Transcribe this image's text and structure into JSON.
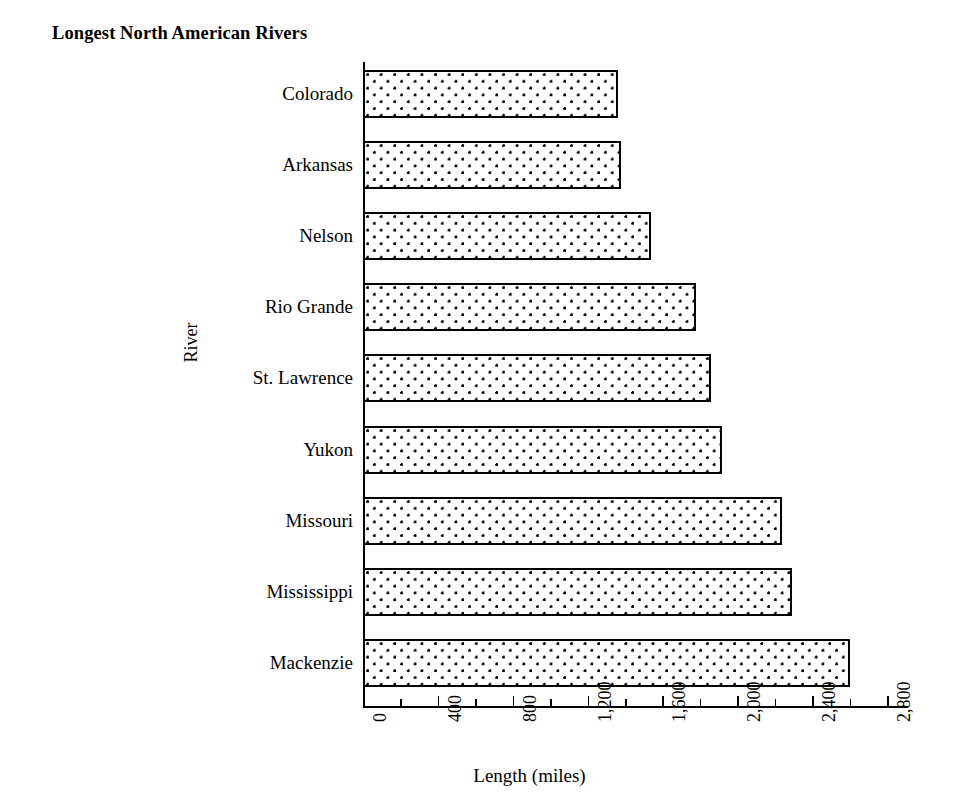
{
  "chart_data": {
    "type": "bar",
    "orientation": "horizontal",
    "title": "Longest North American Rivers",
    "xlabel": "Length (miles)",
    "ylabel": "River",
    "categories": [
      "Colorado",
      "Arkansas",
      "Nelson",
      "Rio Grande",
      "St. Lawrence",
      "Yukon",
      "Missouri",
      "Mississippi",
      "Mackenzie"
    ],
    "values": [
      1360,
      1380,
      1540,
      1780,
      1860,
      1920,
      2240,
      2290,
      2600
    ],
    "xlim": [
      0,
      2900
    ],
    "xticks": [
      0,
      400,
      800,
      1200,
      1600,
      2000,
      2400,
      2800
    ],
    "xticklabels": [
      "0",
      "400",
      "800",
      "1,200",
      "1,600",
      "2,000",
      "2,400",
      "2,800"
    ],
    "xminorticks": [
      200,
      600,
      1000,
      1400,
      1800,
      2200,
      2600
    ],
    "grid": false,
    "legend": false,
    "bar_fill": "dotted-pattern",
    "bar_edge_color": "#000000",
    "bar_face_color": "#ffffff",
    "background_color": "#ffffff"
  }
}
